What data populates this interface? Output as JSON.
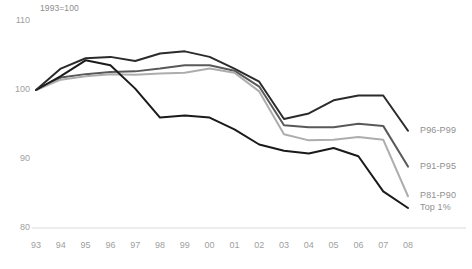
{
  "chart_data": {
    "type": "line",
    "title": "",
    "subtitle": "1993=100",
    "xlabel": "",
    "ylabel": "",
    "ylim": [
      80,
      110
    ],
    "yticks": [
      80,
      90,
      100,
      110
    ],
    "ytick_labels": [
      "80",
      "90",
      "100",
      "110"
    ],
    "grid": false,
    "legend_position": "right-inline",
    "x": [
      1993,
      1994,
      1995,
      1996,
      1997,
      1998,
      1999,
      2000,
      2001,
      2002,
      2003,
      2004,
      2005,
      2006,
      2007,
      2008
    ],
    "xtick_labels": [
      "93",
      "94",
      "95",
      "96",
      "97",
      "98",
      "99",
      "00",
      "01",
      "02",
      "03",
      "04",
      "05",
      "06",
      "07",
      "08"
    ],
    "series": [
      {
        "name": "P96-P99",
        "color": "#2b2b2b",
        "width": 2.0,
        "values": [
          100.0,
          103.1,
          104.6,
          104.8,
          104.2,
          105.3,
          105.6,
          104.8,
          103.1,
          101.2,
          95.8,
          96.6,
          98.5,
          99.2,
          99.2,
          94.1
        ]
      },
      {
        "name": "P91-P95",
        "color": "#595959",
        "width": 2.0,
        "values": [
          100.0,
          101.8,
          102.3,
          102.6,
          102.7,
          103.1,
          103.6,
          103.6,
          102.8,
          100.5,
          94.9,
          94.6,
          94.6,
          95.1,
          94.8,
          88.9
        ]
      },
      {
        "name": "P81-P90",
        "color": "#adadad",
        "width": 2.0,
        "values": [
          100.0,
          101.5,
          102.0,
          102.3,
          102.2,
          102.4,
          102.5,
          103.1,
          102.5,
          99.8,
          93.6,
          92.7,
          92.8,
          93.2,
          92.8,
          84.6
        ]
      },
      {
        "name": "Top 1%",
        "color": "#1a1a1a",
        "width": 2.0,
        "values": [
          100.0,
          102.0,
          104.3,
          103.6,
          100.2,
          96.0,
          96.3,
          96.0,
          94.3,
          92.1,
          91.2,
          90.8,
          91.6,
          90.4,
          85.3,
          82.9
        ]
      }
    ]
  },
  "axis": {
    "note": "1993=100",
    "baseline_color": "#d9d9d9"
  },
  "legend": {
    "items": [
      {
        "label": "P96-P99"
      },
      {
        "label": "P91-P95"
      },
      {
        "label": "P81-P90"
      },
      {
        "label": "Top 1%"
      }
    ]
  }
}
